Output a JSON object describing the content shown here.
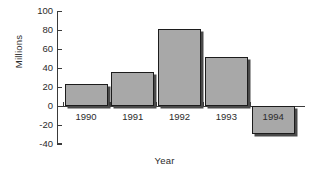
{
  "chart_data": {
    "type": "bar",
    "title": "",
    "xlabel": "Year",
    "ylabel": "Millions",
    "categories": [
      "1990",
      "1991",
      "1992",
      "1993",
      "1994"
    ],
    "values": [
      23,
      36,
      81,
      52,
      -29
    ],
    "ylim": [
      -40,
      100
    ],
    "yticks": [
      -40,
      -20,
      0,
      20,
      40,
      60,
      80,
      100
    ],
    "ytick_labels": [
      "-40",
      "-20",
      "0",
      "20",
      "40",
      "60",
      "80",
      "100"
    ],
    "grid": false,
    "legend": null,
    "bar_color": "#a8a8a8",
    "bar_edge_color": "#1c1c1c",
    "shadow_color": "#4a4a4a",
    "axis_color": "#3a3a3a",
    "background": "#ffffff"
  }
}
